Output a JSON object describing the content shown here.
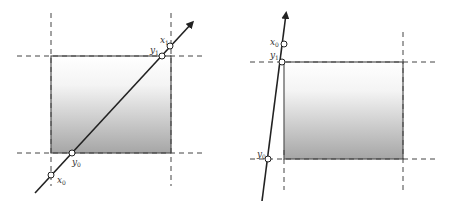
{
  "diagram": {
    "type": "line-clipping-illustration",
    "colors": {
      "line": "#222222",
      "rect_border": "#555555",
      "dashed": "#444444",
      "gradient_top": "#ffffff",
      "gradient_bottom": "#a8a8a8",
      "point_fill": "#ffffff"
    },
    "panels": [
      {
        "name": "left-panel",
        "rect": {
          "x1": 51,
          "y1": 56,
          "x2": 171,
          "y2": 153
        },
        "line": {
          "from": [
            35,
            193
          ],
          "to": [
            193,
            22
          ]
        },
        "points": [
          {
            "label": "x",
            "sub": "0",
            "cx": 51,
            "cy": 175,
            "lx": 57,
            "ly": 183
          },
          {
            "label": "y",
            "sub": "0",
            "cx": 72,
            "cy": 153,
            "lx": 72,
            "ly": 165
          },
          {
            "label": "y",
            "sub": "1",
            "cx": 162,
            "cy": 56,
            "lx": 150,
            "ly": 53
          },
          {
            "label": "x",
            "sub": "1",
            "cx": 170,
            "cy": 46,
            "lx": 160,
            "ly": 43
          }
        ]
      },
      {
        "name": "right-panel",
        "rect": {
          "x1": 284,
          "y1": 62,
          "x2": 403,
          "y2": 159
        },
        "line": {
          "from": [
            262,
            201
          ],
          "to": [
            287,
            12
          ]
        },
        "points": [
          {
            "label": "x",
            "sub": "0",
            "cx": 284,
            "cy": 44,
            "lx": 270,
            "ly": 45
          },
          {
            "label": "y",
            "sub": "1",
            "cx": 282,
            "cy": 62,
            "lx": 270,
            "ly": 58
          },
          {
            "label": "y",
            "sub": "0",
            "cx": 268,
            "cy": 159,
            "lx": 257,
            "ly": 157
          }
        ]
      }
    ]
  }
}
